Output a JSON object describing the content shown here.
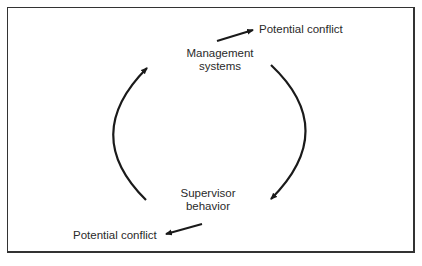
{
  "diagram": {
    "nodes": [
      {
        "id": "management_systems",
        "lines": [
          "Management",
          "systems"
        ]
      },
      {
        "id": "supervisor_behavior",
        "lines": [
          "Supervisor",
          "behavior"
        ]
      }
    ],
    "outcomes": {
      "top": "Potential conflict",
      "bottom": "Potential conflict"
    },
    "edges": [
      {
        "from": "management_systems",
        "to": "supervisor_behavior",
        "style": "curved-arrow-right"
      },
      {
        "from": "supervisor_behavior",
        "to": "management_systems",
        "style": "curved-arrow-left"
      },
      {
        "from": "management_systems",
        "to": "potential_conflict_top",
        "style": "straight-arrow"
      },
      {
        "from": "supervisor_behavior",
        "to": "potential_conflict_bottom",
        "style": "straight-arrow"
      }
    ],
    "colors": {
      "stroke": "#1a1a1a",
      "text": "#2a2a2a",
      "background": "#ffffff",
      "border": "#333333"
    }
  }
}
